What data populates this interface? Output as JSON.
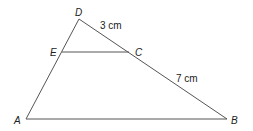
{
  "figure": {
    "type": "triangle-with-parallel-segment",
    "points": {
      "A": {
        "label": "A",
        "x": 26,
        "y": 119
      },
      "B": {
        "label": "B",
        "x": 227,
        "y": 119
      },
      "D": {
        "label": "D",
        "x": 79,
        "y": 19
      },
      "E": {
        "label": "E",
        "x": 62,
        "y": 52
      },
      "C": {
        "label": "C",
        "x": 129,
        "y": 52
      }
    },
    "measurements": {
      "DC": "3 cm",
      "CB": "7 cm"
    },
    "line_color": "#555555"
  }
}
